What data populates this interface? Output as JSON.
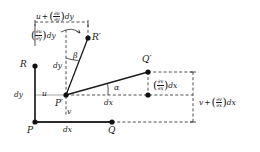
{
  "figure": {
    "type": "geometric-diagram",
    "width": 260,
    "height": 152,
    "background": "#ffffff",
    "line_color": "#1a1a1a",
    "gray_color": "#9a9a9a"
  },
  "points": [
    {
      "id": "P",
      "label": "P",
      "x": 35,
      "y": 122,
      "label_x": 29,
      "label_y": 128,
      "style": "solid-dot"
    },
    {
      "id": "Q",
      "label": "Q",
      "x": 112,
      "y": 122,
      "label_x": 108,
      "label_y": 128,
      "style": "solid-dot"
    },
    {
      "id": "R",
      "label": "R",
      "x": 35,
      "y": 66,
      "label_x": 22,
      "label_y": 62,
      "style": "solid-dot"
    },
    {
      "id": "Pp",
      "label": "P′",
      "x": 66,
      "y": 95,
      "label_x": 58,
      "label_y": 100,
      "style": "solid-dot"
    },
    {
      "id": "Qp",
      "label": "Q′",
      "x": 148,
      "y": 72,
      "label_x": 143,
      "label_y": 57,
      "style": "solid-dot"
    },
    {
      "id": "Rp",
      "label": "R′",
      "x": 88,
      "y": 38,
      "label_x": 92,
      "label_y": 34,
      "style": "solid-dot"
    },
    {
      "id": "Qbase",
      "label": "",
      "x": 148,
      "y": 95,
      "label_x": 0,
      "label_y": 0,
      "style": "solid-dot"
    }
  ],
  "labels": {
    "top_bracket": {
      "lead": "u",
      "op": "+",
      "num": "∂u",
      "den": "∂y",
      "tail": "dy"
    },
    "upper_left": {
      "lead": "",
      "op": "",
      "num": "∂u",
      "den": "∂y",
      "tail": "dy"
    },
    "qprime_drop": {
      "lead": "",
      "op": "",
      "num": "∂v",
      "den": "∂x",
      "tail": "dx"
    },
    "right_bracket": {
      "lead": "v",
      "op": "+",
      "num": "∂v",
      "den": "∂x",
      "tail": "dx"
    },
    "dy_left": "dy",
    "dy_inner": "dy",
    "dx_bottom": "dx",
    "dx_middle": "dx",
    "u_label": "u",
    "v_label": "v",
    "alpha": "α",
    "beta": "β"
  },
  "segments": {
    "solid_black": [
      {
        "name": "left-edge-PR",
        "x1": 35,
        "y1": 122,
        "x2": 35,
        "y2": 66
      },
      {
        "name": "bottom-edge-PQ",
        "x1": 35,
        "y1": 122,
        "x2": 112,
        "y2": 122
      },
      {
        "name": "deformed-PQ",
        "x1": 66,
        "y1": 95,
        "x2": 148,
        "y2": 72
      },
      {
        "name": "deformed-PR",
        "x1": 66,
        "y1": 95,
        "x2": 88,
        "y2": 38
      }
    ],
    "gray_solid": [
      {
        "name": "u-velocity-line",
        "x1": 35,
        "y1": 95,
        "x2": 66,
        "y2": 95
      }
    ],
    "dashed": [
      {
        "name": "vertical-undeformed-dy",
        "x1": 66,
        "y1": 95,
        "x2": 66,
        "y2": 30
      },
      {
        "name": "horizontal-undeformed-dx",
        "x1": 66,
        "y1": 95,
        "x2": 195,
        "y2": 95
      },
      {
        "name": "qprime-vertical-drop",
        "x1": 148,
        "y1": 72,
        "x2": 148,
        "y2": 95
      },
      {
        "name": "qprime-horizontal-to-bracket",
        "x1": 148,
        "y1": 72,
        "x2": 195,
        "y2": 72
      },
      {
        "name": "q-to-right-bracket",
        "x1": 112,
        "y1": 122,
        "x2": 195,
        "y2": 122
      },
      {
        "name": "rprime-drop",
        "x1": 88,
        "y1": 38,
        "x2": 88,
        "y2": 22
      },
      {
        "name": "v-drop-from-Pprime",
        "x1": 66,
        "y1": 95,
        "x2": 66,
        "y2": 118
      }
    ],
    "brackets": [
      {
        "name": "top-bracket",
        "x1": 35,
        "y1": 22,
        "x2": 88,
        "y2": 22,
        "tick": "down",
        "tick_len": 5
      },
      {
        "name": "right-bracket",
        "x1": 195,
        "y1": 72,
        "x2": 195,
        "y2": 122,
        "tick": "left",
        "tick_len": 5
      },
      {
        "name": "upper-left-bracket",
        "x1": 35,
        "y1": 24,
        "x2": 35,
        "y2": 44,
        "tick": "none",
        "tick_len": 0
      }
    ]
  },
  "angles": [
    {
      "name": "alpha",
      "symbol": "α",
      "vertex": "P′",
      "between": [
        "deformed-PQ",
        "horizontal-undeformed-dx"
      ],
      "label_x": 116,
      "label_y": 86
    },
    {
      "name": "beta",
      "symbol": "β",
      "vertex": "P′",
      "between": [
        "deformed-PR",
        "vertical-undeformed-dy"
      ],
      "label_x": 75,
      "label_y": 55
    }
  ]
}
